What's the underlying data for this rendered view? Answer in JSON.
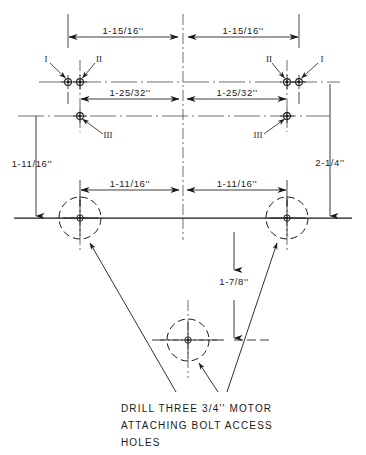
{
  "drawing": {
    "title": "Motor Attaching Bolt Access Hole Layout",
    "line_color": "#1a1a1a",
    "background_color": "#ffffff",
    "dimensions": {
      "top_left": "1-15/16''",
      "top_right": "1-15/16''",
      "mid_left": "1-25/32''",
      "mid_right": "1-25/32''",
      "lower_left": "1-11/16''",
      "lower_right": "1-11/16''",
      "vertical_left": "1-11/16''",
      "vertical_right": "2-1/4''",
      "vertical_center": "1-7/8''"
    },
    "hole_labels": {
      "left_one": "I",
      "left_two": "II",
      "left_three": "III",
      "right_one": "I",
      "right_two": "II",
      "right_three": "III"
    },
    "note": {
      "line1": "DRILL THREE 3/4'' MOTOR",
      "line2": "ATTACHING BOLT ACCESS",
      "line3": "HOLES"
    }
  }
}
